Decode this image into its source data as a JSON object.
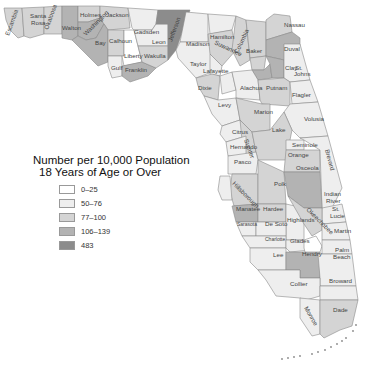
{
  "legend": {
    "title_line1": "Number per 10,000 Population",
    "title_line2": "18 Years of Age or Over",
    "items": [
      {
        "label": "0–25",
        "color": "#ffffff"
      },
      {
        "label": "50–76",
        "color": "#eeeeee"
      },
      {
        "label": "77–100",
        "color": "#d4d4d4"
      },
      {
        "label": "106–139",
        "color": "#b3b3b3"
      },
      {
        "label": "483",
        "color": "#8c8c8c"
      }
    ]
  },
  "counties": [
    {
      "name": "Escambia",
      "shade": "77–100"
    },
    {
      "name": "Santa Rosa",
      "shade": "77–100"
    },
    {
      "name": "Okaloosa",
      "shade": "77–100"
    },
    {
      "name": "Walton",
      "shade": "106–139"
    },
    {
      "name": "Holmes",
      "shade": "77–100"
    },
    {
      "name": "Washington",
      "shade": "106–139"
    },
    {
      "name": "Jackson",
      "shade": "77–100"
    },
    {
      "name": "Bay",
      "shade": "106–139"
    },
    {
      "name": "Calhoun",
      "shade": "77–100"
    },
    {
      "name": "Gulf",
      "shade": "50–76"
    },
    {
      "name": "Franklin",
      "shade": "106–139"
    },
    {
      "name": "Liberty",
      "shade": "0–25"
    },
    {
      "name": "Gadsden",
      "shade": "50–76"
    },
    {
      "name": "Leon",
      "shade": "50–76"
    },
    {
      "name": "Wakulla",
      "shade": "77–100"
    },
    {
      "name": "Jefferson",
      "shade": "483"
    },
    {
      "name": "Madison",
      "shade": "50–76"
    },
    {
      "name": "Taylor",
      "shade": "50–76"
    },
    {
      "name": "Hamilton",
      "shade": "50–76"
    },
    {
      "name": "Suwannee",
      "shade": "77–100"
    },
    {
      "name": "Columbia",
      "shade": "77–100"
    },
    {
      "name": "Lafayette",
      "shade": "50–76"
    },
    {
      "name": "Dixie",
      "shade": "77–100"
    },
    {
      "name": "Gilchrist",
      "shade": "50–76"
    },
    {
      "name": "Baker",
      "shade": "77–100"
    },
    {
      "name": "Union",
      "shade": "77–100"
    },
    {
      "name": "Bradford",
      "shade": "106–139"
    },
    {
      "name": "Nassau",
      "shade": "77–100"
    },
    {
      "name": "Duval",
      "shade": "106–139"
    },
    {
      "name": "Clay",
      "shade": "106–139"
    },
    {
      "name": "St. Johns",
      "shade": "50–76"
    },
    {
      "name": "Alachua",
      "shade": "50–76"
    },
    {
      "name": "Putnam",
      "shade": "77–100"
    },
    {
      "name": "Flagler",
      "shade": "50–76"
    },
    {
      "name": "Levy",
      "shade": "50–76"
    },
    {
      "name": "Marion",
      "shade": "77–100"
    },
    {
      "name": "Volusia",
      "shade": "50–76"
    },
    {
      "name": "Citrus",
      "shade": "50–76"
    },
    {
      "name": "Sumter",
      "shade": "77–100"
    },
    {
      "name": "Lake",
      "shade": "77–100"
    },
    {
      "name": "Seminole",
      "shade": "50–76"
    },
    {
      "name": "Orange",
      "shade": "77–100"
    },
    {
      "name": "Brevard",
      "shade": "50–76"
    },
    {
      "name": "Hernando",
      "shade": "50–76"
    },
    {
      "name": "Pasco",
      "shade": "50–76"
    },
    {
      "name": "Hillsborough",
      "shade": "77–100"
    },
    {
      "name": "Pinellas",
      "shade": "50–76"
    },
    {
      "name": "Polk",
      "shade": "77–100"
    },
    {
      "name": "Osceola",
      "shade": "106–139"
    },
    {
      "name": "Indian River",
      "shade": "50–76"
    },
    {
      "name": "Manatee",
      "shade": "106–139"
    },
    {
      "name": "Hardee",
      "shade": "77–100"
    },
    {
      "name": "Highlands",
      "shade": "50–76"
    },
    {
      "name": "Okeechobee",
      "shade": "77–100"
    },
    {
      "name": "St. Lucie",
      "shade": "50–76"
    },
    {
      "name": "Sarasota",
      "shade": "50–76"
    },
    {
      "name": "De Soto",
      "shade": "50–76"
    },
    {
      "name": "Charlotte",
      "shade": "50–76"
    },
    {
      "name": "Glades",
      "shade": "50–76"
    },
    {
      "name": "Martin",
      "shade": "50–76"
    },
    {
      "name": "Lee",
      "shade": "50–76"
    },
    {
      "name": "Hendry",
      "shade": "106–139"
    },
    {
      "name": "Palm Beach",
      "shade": "50–76"
    },
    {
      "name": "Collier",
      "shade": "50–76"
    },
    {
      "name": "Broward",
      "shade": "50–76"
    },
    {
      "name": "Monroe",
      "shade": "50–76"
    },
    {
      "name": "Dade",
      "shade": "77–100"
    }
  ]
}
